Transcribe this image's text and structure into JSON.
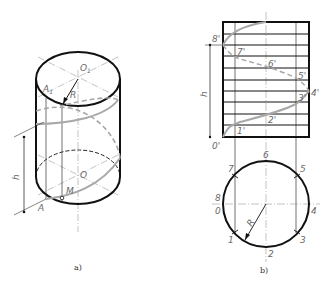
{
  "figure": {
    "colors": {
      "outline": "#111111",
      "helix": "#a8a8a8",
      "axis": "#8a8a8a",
      "label": "#6a6a6a",
      "background": "#ffffff"
    }
  },
  "panel_a": {
    "caption": "a)",
    "labels": {
      "top_center": "O",
      "top_center_sub": "1",
      "top_point": "A",
      "top_point_sub": "1",
      "radius": "R",
      "bottom_center": "O",
      "bottom_point": "A",
      "moving_point": "M",
      "pitch": "h"
    }
  },
  "panel_b": {
    "caption": "b)",
    "front_view_labels": [
      "0'",
      "1'",
      "2'",
      "3'",
      "4'",
      "5'",
      "6'",
      "7'",
      "8'"
    ],
    "pitch_label": "h",
    "top_view_labels": [
      "0",
      "1",
      "2",
      "3",
      "4",
      "5",
      "6",
      "7",
      "8"
    ],
    "radius_label": "R",
    "divisions": 8
  }
}
